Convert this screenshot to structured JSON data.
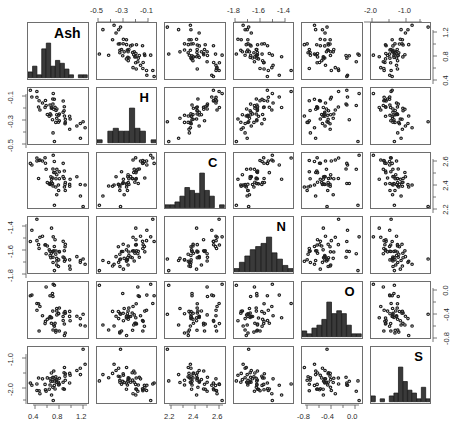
{
  "figure": {
    "title": "",
    "type": "scatterplot-matrix",
    "variables": [
      "Ash",
      "H",
      "C",
      "N",
      "O",
      "S"
    ],
    "n_rows": 6,
    "n_cols": 6,
    "point_marker": "open-circle",
    "hist_fill": "#3a3a3a",
    "panel_border": "#6e6e6e",
    "background": "#ffffff"
  },
  "chart_data": {
    "type": "scatter",
    "title": "",
    "xlabel": "",
    "ylabel": "",
    "grid": false,
    "legend": "none",
    "matrix": "scatterplot matrix (SPLOM), 6x6, histograms on diagonal",
    "variables": [
      {
        "name": "Ash",
        "index": 0,
        "axis_side_top": "",
        "axis_side_bottom": "0.4, 0.8, 1.2",
        "axis_side_left": "",
        "axis_side_right": "0.4, 0.8, 1.2",
        "ticks": [
          0.4,
          0.8,
          1.2
        ],
        "range": [
          0.25,
          1.55
        ],
        "hist_bins": [
          2,
          4,
          1,
          10,
          12,
          4,
          6,
          5,
          3,
          1,
          0,
          1,
          1
        ]
      },
      {
        "name": "H",
        "index": 1,
        "axis_side_top": "-0.5, -0.3, -0.1",
        "axis_side_bottom": "",
        "axis_side_left": "-0.1, -0.3, -0.5",
        "axis_side_right": "",
        "ticks": [
          -0.5,
          -0.3,
          -0.1
        ],
        "range": [
          -0.66,
          0.02
        ],
        "hist_bins": [
          1,
          0,
          4,
          5,
          4,
          4,
          12,
          5,
          4,
          0,
          1
        ]
      },
      {
        "name": "C",
        "index": 2,
        "axis_side_top": "",
        "axis_side_bottom": "2.2, 2.4, 2.6",
        "axis_side_left": "",
        "axis_side_right": "2.2, 2.4, 2.6",
        "ticks": [
          2.2,
          2.4,
          2.6
        ],
        "range": [
          2.1,
          2.72
        ],
        "hist_bins": [
          1,
          1,
          2,
          4,
          7,
          6,
          5,
          12,
          6,
          4,
          0,
          1
        ]
      },
      {
        "name": "N",
        "index": 3,
        "axis_side_top": "-1.8, -1.6, -1.4",
        "axis_side_bottom": "",
        "axis_side_left": "-1.4, -1.6, -1.8",
        "axis_side_right": "",
        "ticks": [
          -1.8,
          -1.6,
          -1.4
        ],
        "range": [
          -1.92,
          -1.3
        ],
        "hist_bins": [
          1,
          3,
          5,
          7,
          8,
          9,
          11,
          6,
          4,
          2,
          1
        ]
      },
      {
        "name": "O",
        "index": 4,
        "axis_side_top": "",
        "axis_side_bottom": "-0.8, -0.4, 0.0",
        "axis_side_left": "",
        "axis_side_right": "0.0, -0.4, -0.8",
        "ticks": [
          -0.8,
          -0.4,
          0.0
        ],
        "range": [
          -1.05,
          0.2
        ],
        "hist_bins": [
          2,
          1,
          3,
          4,
          6,
          12,
          8,
          9,
          8,
          4,
          1,
          1
        ]
      },
      {
        "name": "S",
        "index": 5,
        "axis_side_top": "-2.0, -1.0",
        "axis_side_bottom": "",
        "axis_side_left": "-1.0, -2.0",
        "axis_side_right": "",
        "ticks": [
          -2.0,
          -1.0
        ],
        "range": [
          -2.6,
          -0.3
        ],
        "hist_bins": [
          2,
          0,
          1,
          0,
          2,
          3,
          12,
          7,
          4,
          3,
          1,
          5,
          1
        ]
      }
    ],
    "correlations": {
      "Ash_H": "negative",
      "Ash_C": "negative",
      "Ash_N": "negative",
      "Ash_O": "weak",
      "Ash_S": "negative",
      "H_C": "strong positive",
      "H_N": "positive",
      "H_O": "weak positive",
      "H_S": "negative",
      "C_N": "strong positive",
      "C_O": "weak",
      "C_S": "negative",
      "N_O": "weak positive",
      "N_S": "negative",
      "O_S": "negative"
    },
    "n_points": 52
  },
  "axes": {
    "top": [
      {
        "col": 1,
        "labels": [
          "-0.5",
          "-0.3",
          "-0.1"
        ]
      },
      {
        "col": 3,
        "labels": [
          "-1.8",
          "-1.6",
          "-1.4"
        ]
      },
      {
        "col": 5,
        "labels": [
          "-2.0",
          "-1.0"
        ]
      }
    ],
    "bottom": [
      {
        "col": 0,
        "labels": [
          "0.4",
          "0.8",
          "1.2"
        ]
      },
      {
        "col": 2,
        "labels": [
          "2.2",
          "2.4",
          "2.6"
        ]
      },
      {
        "col": 4,
        "labels": [
          "-0.8",
          "-0.4",
          "0.0"
        ]
      }
    ],
    "left": [
      {
        "row": 1,
        "labels": [
          "-0.1",
          "-0.3",
          "-0.5"
        ]
      },
      {
        "row": 3,
        "labels": [
          "-1.4",
          "-1.6",
          "-1.8"
        ]
      },
      {
        "row": 5,
        "labels": [
          "-1.0",
          "-2.0"
        ]
      }
    ],
    "right": [
      {
        "row": 0,
        "labels": [
          "1.2",
          "0.8",
          "0.4"
        ]
      },
      {
        "row": 2,
        "labels": [
          "2.6",
          "2.4",
          "2.2"
        ]
      },
      {
        "row": 4,
        "labels": [
          "0.0",
          "-0.4",
          "-0.8"
        ]
      }
    ]
  },
  "labels": {
    "d0": "Ash",
    "d1": "H",
    "d2": "C",
    "d3": "N",
    "d4": "O",
    "d5": "S"
  }
}
